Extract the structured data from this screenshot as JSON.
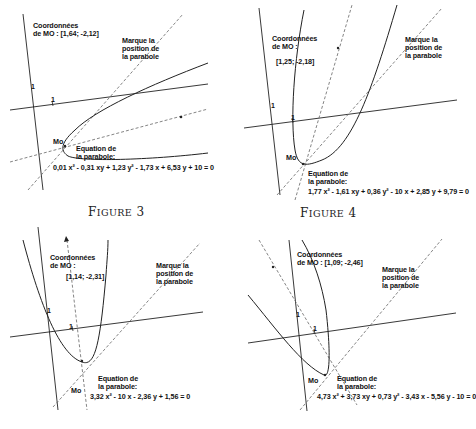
{
  "figures": [
    {
      "id": "figure-3",
      "caption_first": "F",
      "caption_rest": "IGURE",
      "caption_number": "3",
      "coords_label_line1": "Coordonnées",
      "coords_label_line2": "de MO :  [1,64; -2,12]",
      "marker_label_line1": "Marque la",
      "marker_label_line2": "position de",
      "marker_label_line3": "la parabole",
      "point_label": "Mo",
      "equation_label_line1": "Equation de",
      "equation_label_line2": "la parabole:",
      "equation": "0,01 x² - 0,31 xy + 1,23 y² - 1,73 x + 6,53 y + 10 = 0",
      "tick_x": "1",
      "tick_y": "1"
    },
    {
      "id": "figure-4",
      "caption_first": "F",
      "caption_rest": "IGURE",
      "caption_number": "4",
      "coords_label_line1": "Coordonnées",
      "coords_label_line2": "de MO :",
      "coords_value": "[1,25; -2,18]",
      "marker_label_line1": "Marque la",
      "marker_label_line2": "position de",
      "marker_label_line3": "la parabole",
      "point_label": "Mo",
      "equation_label_line1": "Equation de",
      "equation_label_line2": "la parabole:",
      "equation": "1,77 x² - 1,61 xy + 0,36 y² - 10 x + 2,85 y + 9,79 = 0",
      "tick_x": "1",
      "tick_y": "1"
    },
    {
      "id": "figure-5",
      "coords_label_line1": "Coordonnées",
      "coords_label_line2": "de MO :",
      "coords_value": "[1,14; -2,31]",
      "marker_label_line1": "Marque la",
      "marker_label_line2": "position de",
      "marker_label_line3": "la parabole",
      "point_label": "Mo",
      "equation_label_line1": "Equation de",
      "equation_label_line2": "la parabole:",
      "equation": "3,32 x² - 10 x - 2,36 y + 1,56 = 0",
      "tick_x": "1",
      "tick_y": "1"
    },
    {
      "id": "figure-6",
      "coords_label_line1": "Coordonnées",
      "coords_label_line2": "de MO :  [1,09; -2,46]",
      "marker_label_line1": "Marque la",
      "marker_label_line2": "position de",
      "marker_label_line3": "la parabole",
      "point_label": "Mo",
      "equation_label_line1": "Equation de",
      "equation_label_line2": "la parabole:",
      "equation": "4,73 x² + 3,73 xy + 0,73 y² - 3,43 x - 5,56 y - 10 = 0",
      "tick_x": "1",
      "tick_y": "1"
    }
  ],
  "colors": {
    "line": "#222222",
    "dashed": "#555555",
    "text": "#111111",
    "background": "#ffffff"
  }
}
